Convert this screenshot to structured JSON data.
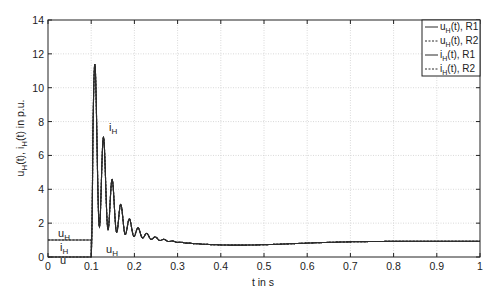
{
  "chart_data": {
    "type": "line",
    "title": "",
    "xlabel": "t in s",
    "ylabel": "u_H(t), i_H(t) in p.u.",
    "xlim": [
      0,
      1
    ],
    "ylim": [
      0,
      14
    ],
    "xticks": [
      0,
      0.1,
      0.2,
      0.3,
      0.4,
      0.5,
      0.6,
      0.7,
      0.8,
      0.9,
      1
    ],
    "xtick_labels": [
      "0",
      "0.1",
      "0.2",
      "0.3",
      "0.4",
      "0.5",
      "0.6",
      "0.7",
      "0.8",
      "0.9",
      "1"
    ],
    "yticks": [
      0,
      2,
      4,
      6,
      8,
      10,
      12,
      14
    ],
    "ytick_labels": [
      "0",
      "2",
      "4",
      "6",
      "8",
      "10",
      "12",
      "14"
    ],
    "grid": true,
    "legend_position": "upper right",
    "legend": [
      {
        "label": "u_H(t), R1",
        "style": "solid"
      },
      {
        "label": "u_H(t), R2",
        "style": "dashed"
      },
      {
        "label": "i_H(t), R1",
        "style": "solid"
      },
      {
        "label": "i_H(t), R2",
        "style": "dashed"
      }
    ],
    "annotations": [
      {
        "text": "u_H",
        "x": 0.02,
        "y": 1.4
      },
      {
        "text": "i_H",
        "x": 0.02,
        "y": 0.35
      },
      {
        "text": "i_H",
        "x": 0.135,
        "y": 7.0
      },
      {
        "text": "u_H",
        "x": 0.115,
        "y": 0.35
      }
    ],
    "series": [
      {
        "name": "u_H(t)",
        "description": "voltage: 1.0 p.u. for t<0.1, drops to 0 at 0.1, then recovers",
        "x": [
          0,
          0.1,
          0.1,
          0.105,
          0.2,
          0.3,
          0.4,
          0.5,
          0.6,
          0.7,
          0.8,
          0.9,
          1.0
        ],
        "values": [
          1.0,
          1.0,
          0.0,
          1.6,
          1.3,
          0.9,
          0.7,
          0.75,
          0.85,
          0.9,
          0.92,
          0.93,
          0.93
        ]
      },
      {
        "name": "i_H(t)",
        "description": "current: 0 for t<0.1, damped oscillation (period ~0.02 s) after switching at 0.1",
        "x": [
          0,
          0.1,
          0.109,
          0.12,
          0.13,
          0.14,
          0.15,
          0.16,
          0.17,
          0.18,
          0.19,
          0.2,
          0.21,
          0.22,
          0.23,
          0.25,
          0.27,
          0.3,
          0.35,
          0.4,
          0.5,
          0.6,
          0.7,
          0.8,
          0.9,
          1.0
        ],
        "values": [
          0,
          0,
          13.7,
          1.6,
          9.1,
          1.8,
          6.4,
          2.0,
          4.6,
          2.1,
          3.5,
          2.0,
          2.7,
          1.8,
          2.2,
          1.6,
          1.4,
          1.0,
          0.8,
          0.7,
          0.75,
          0.85,
          0.9,
          0.92,
          0.93,
          0.93
        ]
      }
    ]
  },
  "labels": {
    "xlabel": "t in s",
    "ylabel_u": "u",
    "ylabel_sub_h1": "H",
    "ylabel_mid": "(t), i",
    "ylabel_sub_h2": "H",
    "ylabel_end": "(t) in p.u.",
    "legend_1_main": "u",
    "legend_1_sub": "H",
    "legend_1_rest": "(t), R1",
    "legend_2_main": "u",
    "legend_2_sub": "H",
    "legend_2_rest": "(t), R2",
    "legend_3_main": "i",
    "legend_3_sub": "H",
    "legend_3_rest": "(t), R1",
    "legend_4_main": "i",
    "legend_4_sub": "H",
    "legend_4_rest": "(t), R2",
    "annot_main_u": "u",
    "annot_main_i": "i",
    "annot_sub": "H"
  },
  "colors": {
    "line": "#2a2a2a",
    "grid": "#cfcfcf",
    "axis": "#222222"
  }
}
